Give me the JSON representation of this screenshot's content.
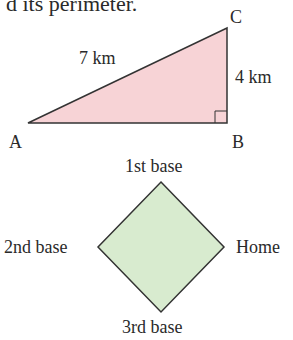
{
  "header_text": "d its perimeter.",
  "triangle": {
    "fill": "#f7d3d6",
    "stroke": "#333333",
    "vertices": {
      "A": "A",
      "B": "B",
      "C": "C"
    },
    "side_labels": {
      "hypotenuse": "7 km",
      "vertical": "4 km"
    },
    "right_angle_at": "B"
  },
  "diamond": {
    "fill": "#d8ebcf",
    "stroke": "#333333",
    "labels": {
      "top": "1st base",
      "left": "2nd base",
      "right": "Home",
      "bottom": "3rd base"
    }
  }
}
